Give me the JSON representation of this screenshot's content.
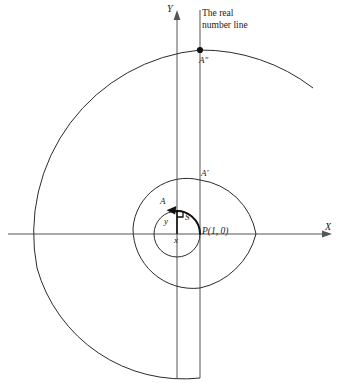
{
  "figure": {
    "title_annotation": "The real\nnumber line",
    "annotation_line1": "The real",
    "annotation_line2": "number line",
    "axes": {
      "x_label": "X",
      "y_label": "Y",
      "origin_px": [
        177,
        234
      ],
      "x_axis_span_px": [
        8,
        330
      ],
      "y_axis_span_px": [
        10,
        378
      ]
    },
    "labels": {
      "A": "A",
      "A_prime": "A′",
      "A_double_prime": "A″",
      "S": "S",
      "x": "x",
      "y": "y",
      "P": "P(1, 0)"
    },
    "points": {
      "P": {
        "label": "P(1, 0)",
        "px": [
          200,
          234
        ],
        "coords": [
          1,
          0
        ],
        "filled": false
      },
      "A": {
        "label": "A",
        "px": [
          168,
          206
        ],
        "filled": false
      },
      "A_prime": {
        "label": "A′",
        "px": [
          200,
          180
        ],
        "filled": false
      },
      "A_double_prime": {
        "label": "A″",
        "px": [
          200,
          50
        ],
        "filled": true
      }
    },
    "real_number_line": {
      "type": "vertical-line",
      "x_px": 200,
      "y_from_px": 10,
      "y_to_px": 378,
      "description": "Vertical line tangent to the unit circle at P(1, 0)"
    },
    "circles": [
      {
        "name": "unit-circle",
        "center_px": [
          177,
          234
        ],
        "radius_px": 23,
        "stroke": "#2b2b2b"
      },
      {
        "name": "middle-circle",
        "center_px": [
          177,
          234
        ],
        "radius_px": 54,
        "stroke": "#2b2b2b"
      },
      {
        "name": "outer-spiral-arc",
        "center_px": [
          177,
          234
        ],
        "radius_px": 184,
        "stroke": "#2b2b2b"
      }
    ],
    "arc_S": {
      "name": "arc-from-P-to-A",
      "center_px": [
        177,
        234
      ],
      "radius_px": 23,
      "start_deg": 0,
      "end_deg": 130,
      "arrow_at": "A",
      "label": "S"
    },
    "right_triangle": {
      "legs": [
        "x",
        "y"
      ],
      "vertical_leg_label": "y",
      "horizontal_leg_label": "x",
      "right_angle_marker": true
    },
    "colors": {
      "stroke": "#2b2b2b",
      "axis": "#555555",
      "thick_stroke": "#111111",
      "text": "#1a1a1a",
      "background": "#ffffff"
    }
  }
}
